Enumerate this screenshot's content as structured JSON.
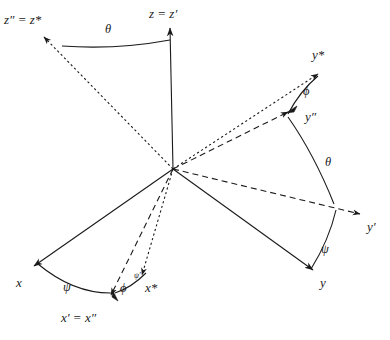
{
  "figure": {
    "background_color": "#ffffff",
    "line_color": "#1a1a1a",
    "origin": {
      "x": 173,
      "y": 169
    }
  },
  "labels": {
    "z_double_prime_star": "z″ = z*",
    "z_prime": "z = z′",
    "theta_top": "θ",
    "y_star": "y*",
    "phi_right": "ϕ",
    "y_double_prime": "y″",
    "theta_right": "θ",
    "y_prime": "y′",
    "psi_right": "ψ",
    "y": "y",
    "x": "x",
    "psi_left": "ψ",
    "phi_left": "ϕ",
    "psi_small": "ψ′",
    "x_star": "x*",
    "x_prime_double_prime": "x′ = x″"
  },
  "axes": [
    {
      "name": "z = z'",
      "style": "solid",
      "arrow": true,
      "from": [
        173,
        169
      ],
      "to": [
        170,
        26
      ]
    },
    {
      "name": "z'' = z*",
      "style": "dotted",
      "arrow": true,
      "from": [
        173,
        169
      ],
      "to": [
        42,
        35
      ]
    },
    {
      "name": "y*",
      "style": "dotted",
      "arrow": true,
      "from": [
        173,
        169
      ],
      "to": [
        320,
        72
      ]
    },
    {
      "name": "y''",
      "style": "dashed",
      "arrow": true,
      "from": [
        173,
        169
      ],
      "to": [
        290,
        110
      ]
    },
    {
      "name": "y'",
      "style": "dashed",
      "arrow": true,
      "from": [
        173,
        169
      ],
      "to": [
        362,
        215
      ]
    },
    {
      "name": "y",
      "style": "solid",
      "arrow": true,
      "from": [
        173,
        169
      ],
      "to": [
        315,
        272
      ]
    },
    {
      "name": "x",
      "style": "solid",
      "arrow": true,
      "from": [
        173,
        169
      ],
      "to": [
        32,
        268
      ]
    },
    {
      "name": "x' = x''",
      "style": "dashed",
      "arrow": true,
      "from": [
        173,
        169
      ],
      "to": [
        110,
        297
      ]
    },
    {
      "name": "x*",
      "style": "dotted",
      "arrow": true,
      "from": [
        173,
        169
      ],
      "to": [
        143,
        277
      ]
    }
  ],
  "arcs": [
    {
      "name": "theta-top",
      "from": [
        62,
        46
      ],
      "to": [
        170,
        40
      ]
    },
    {
      "name": "phi-right",
      "from": [
        318,
        76
      ],
      "to": [
        288,
        114
      ]
    },
    {
      "name": "theta-right",
      "from": [
        288,
        117
      ],
      "to": [
        334,
        204
      ]
    },
    {
      "name": "psi-right",
      "from": [
        336,
        210
      ],
      "to": [
        310,
        270
      ]
    },
    {
      "name": "psi-left",
      "from": [
        38,
        264
      ],
      "to": [
        113,
        293
      ]
    },
    {
      "name": "phi-left",
      "from": [
        115,
        293
      ],
      "to": [
        146,
        273
      ]
    }
  ],
  "arc_arrows": [
    {
      "name": "phi-arc-arrowhead",
      "at": [
        295,
        109
      ]
    },
    {
      "name": "psi-arc-arrowhead",
      "at": [
        115,
        296
      ]
    }
  ]
}
